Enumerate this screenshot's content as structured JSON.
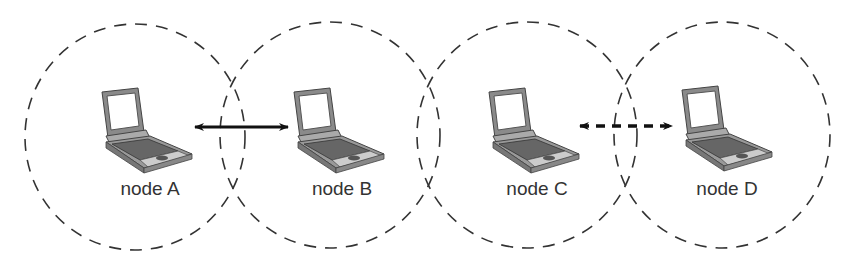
{
  "diagram": {
    "type": "wireless-ad-hoc-network",
    "nodes": [
      {
        "id": "A",
        "label": "node A",
        "cx": 133,
        "cy": 138,
        "laptop_x": 98,
        "label_x": 150,
        "label_y": 178
      },
      {
        "id": "B",
        "label": "node B",
        "cx": 325,
        "cy": 136,
        "laptop_x": 290,
        "label_x": 342,
        "label_y": 178
      },
      {
        "id": "C",
        "label": "node C",
        "cx": 527,
        "cy": 136,
        "laptop_x": 485,
        "label_x": 537,
        "label_y": 178
      },
      {
        "id": "D",
        "label": "node D",
        "cx": 720,
        "cy": 135,
        "laptop_x": 678,
        "label_x": 727,
        "label_y": 178
      }
    ],
    "links": [
      {
        "from": "A",
        "to": "B",
        "style": "solid",
        "x1": 195,
        "x2": 288,
        "y": 127
      },
      {
        "from": "C",
        "to": "D",
        "style": "dashed",
        "x1": 580,
        "x2": 672,
        "y": 126
      }
    ],
    "range_circle_style": "dashed",
    "colors": {
      "stroke": "#333333",
      "arrow": "#111111",
      "laptop_body": "#7a7a7a",
      "laptop_screen": "#ffffff"
    }
  }
}
